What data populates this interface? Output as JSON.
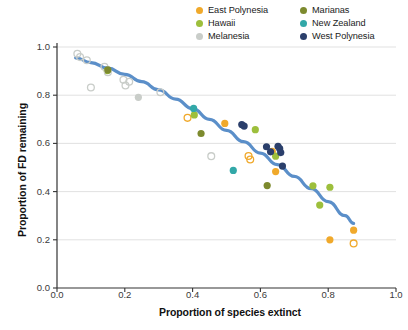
{
  "legend": {
    "position": "top-right",
    "items": [
      {
        "label": "East Polynesia",
        "color": "#f0a92b",
        "key": "east_polynesia"
      },
      {
        "label": "Hawaii",
        "color": "#9dbf3c",
        "key": "hawaii"
      },
      {
        "label": "Melanesia",
        "color": "#c9cdc9",
        "key": "melanesia"
      },
      {
        "label": "Marianas",
        "color": "#7d8a2e",
        "key": "marianas"
      },
      {
        "label": "New Zealand",
        "color": "#32a8a8",
        "key": "new_zealand"
      },
      {
        "label": "West Polynesia",
        "color": "#2b3f6b",
        "key": "west_polynesia"
      }
    ]
  },
  "chart_data": {
    "type": "scatter",
    "title": "",
    "xlabel": "Proportion of species extinct",
    "ylabel": "Proportion of FD remaining",
    "xlim": [
      0.0,
      1.0
    ],
    "ylim": [
      0.0,
      1.0
    ],
    "xticks": [
      "0.0",
      "0.2",
      "0.4",
      "0.6",
      "0.8",
      "1.0"
    ],
    "xtick_values": [
      0.0,
      0.2,
      0.4,
      0.6,
      0.8,
      1.0
    ],
    "yticks": [
      "0.0",
      "0.2",
      "0.4",
      "0.6",
      "0.8",
      "1.0"
    ],
    "ytick_values": [
      0.0,
      0.2,
      0.4,
      0.6,
      0.8,
      1.0
    ],
    "grid": "horizontal",
    "curve": {
      "name": "fitted trend",
      "color": "#5b8fc9",
      "points": [
        [
          0.055,
          0.955
        ],
        [
          0.1,
          0.935
        ],
        [
          0.15,
          0.912
        ],
        [
          0.2,
          0.886
        ],
        [
          0.25,
          0.856
        ],
        [
          0.3,
          0.822
        ],
        [
          0.35,
          0.784
        ],
        [
          0.4,
          0.744
        ],
        [
          0.45,
          0.7
        ],
        [
          0.5,
          0.654
        ],
        [
          0.55,
          0.607
        ],
        [
          0.6,
          0.56
        ],
        [
          0.65,
          0.512
        ],
        [
          0.7,
          0.463
        ],
        [
          0.75,
          0.412
        ],
        [
          0.8,
          0.358
        ],
        [
          0.85,
          0.3
        ],
        [
          0.875,
          0.268
        ]
      ]
    },
    "series": [
      {
        "name": "East Polynesia",
        "color": "#f0a92b",
        "filled": [
          [
            0.495,
            0.683
          ],
          [
            0.635,
            0.567
          ],
          [
            0.645,
            0.483
          ],
          [
            0.805,
            0.2
          ],
          [
            0.875,
            0.24
          ]
        ],
        "open": [
          [
            0.385,
            0.706
          ],
          [
            0.565,
            0.548
          ],
          [
            0.57,
            0.533
          ],
          [
            0.875,
            0.185
          ]
        ]
      },
      {
        "name": "Hawaii",
        "color": "#9dbf3c",
        "filled": [
          [
            0.148,
            0.902
          ],
          [
            0.405,
            0.718
          ],
          [
            0.585,
            0.657
          ],
          [
            0.645,
            0.547
          ],
          [
            0.755,
            0.424
          ],
          [
            0.775,
            0.344
          ],
          [
            0.805,
            0.418
          ]
        ],
        "open": []
      },
      {
        "name": "Melanesia",
        "color": "#c9cdc9",
        "filled": [
          [
            0.24,
            0.791
          ]
        ],
        "open": [
          [
            0.06,
            0.972
          ],
          [
            0.068,
            0.958
          ],
          [
            0.088,
            0.945
          ],
          [
            0.1,
            0.832
          ],
          [
            0.14,
            0.918
          ],
          [
            0.15,
            0.895
          ],
          [
            0.196,
            0.864
          ],
          [
            0.202,
            0.84
          ],
          [
            0.213,
            0.856
          ],
          [
            0.305,
            0.812
          ],
          [
            0.455,
            0.547
          ]
        ]
      },
      {
        "name": "Marianas",
        "color": "#7d8a2e",
        "filled": [
          [
            0.15,
            0.905
          ],
          [
            0.425,
            0.641
          ],
          [
            0.62,
            0.425
          ]
        ],
        "open": []
      },
      {
        "name": "New Zealand",
        "color": "#32a8a8",
        "filled": [
          [
            0.403,
            0.745
          ],
          [
            0.52,
            0.488
          ]
        ],
        "open": []
      },
      {
        "name": "West Polynesia",
        "color": "#2b3f6b",
        "filled": [
          [
            0.545,
            0.678
          ],
          [
            0.552,
            0.672
          ],
          [
            0.618,
            0.586
          ],
          [
            0.63,
            0.565
          ],
          [
            0.652,
            0.588
          ],
          [
            0.657,
            0.578
          ],
          [
            0.66,
            0.562
          ],
          [
            0.665,
            0.506
          ]
        ],
        "open": []
      }
    ]
  }
}
